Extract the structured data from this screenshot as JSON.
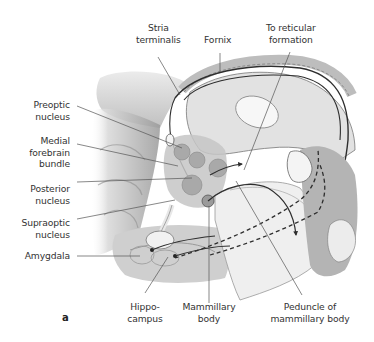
{
  "figure": {
    "panel_letter": "a",
    "labels": {
      "stria_terminalis": "Stria\nterminalis",
      "fornix": "Fornix",
      "to_reticular_formation": "To reticular\nformation",
      "preoptic_nucleus": "Preoptic\nnucleus",
      "medial_forebrain_bundle": "Medial\nforebrain\nbundle",
      "posterior_nucleus": "Posterior\nnucleus",
      "supraoptic_nucleus": "Supraoptic\nnucleus",
      "amygdala": "Amygdala",
      "hippocampus": "Hippo-\ncampus",
      "mammillary_body": "Mammillary\nbody",
      "peduncle_of_mammillary_body": "Peduncle of\nmammillary body"
    },
    "colors": {
      "background": "#ffffff",
      "leader_line": "#555555",
      "pathway": "#2e2e2e",
      "tissue_light": "#e8e8e8",
      "tissue_mid": "#c4c4c4",
      "tissue_dark": "#8a8a8a",
      "nucleus_fill": "#a9a9a9"
    }
  }
}
